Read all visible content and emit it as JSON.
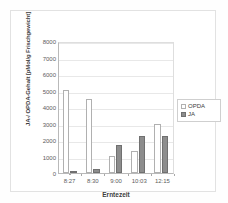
{
  "chart_data": {
    "type": "bar",
    "title": "",
    "xlabel": "Erntezeit",
    "ylabel": "JA-/ OPDA-Gehalt [pMol/g Frischgewicht]",
    "categories": [
      "8:27",
      "8:30",
      "9:00",
      "10:03",
      "12:15"
    ],
    "series": [
      {
        "name": "OPDA",
        "color": "#ffffff",
        "values": [
          5050,
          4500,
          1050,
          1350,
          3000
        ]
      },
      {
        "name": "JA",
        "color": "#8d8d8d",
        "values": [
          100,
          250,
          1700,
          2250,
          2250
        ]
      }
    ],
    "ylim": [
      0,
      8000
    ],
    "yticks": [
      0,
      1000,
      2000,
      3000,
      4000,
      5000,
      6000,
      7000,
      8000
    ],
    "ytick_labels": [
      "0",
      "1000",
      "2000",
      "3000",
      "4000",
      "5000",
      "6000",
      "7000",
      "8000"
    ],
    "grid": true,
    "legend_position": "right"
  },
  "legend": {
    "items": [
      {
        "label": "OPDA",
        "swatch": "hollow-bar-swatch"
      },
      {
        "label": "JA",
        "swatch": "filled-bar-swatch"
      }
    ]
  }
}
